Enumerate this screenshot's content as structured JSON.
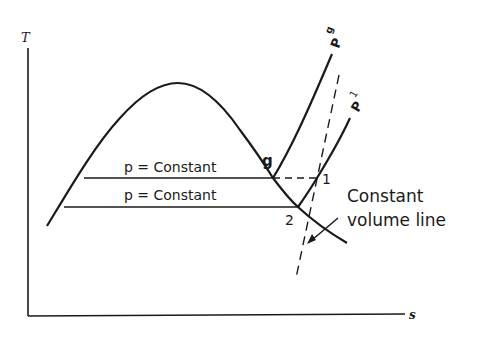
{
  "diagram": {
    "axes": {
      "y_label": "T",
      "x_label": "s"
    },
    "lines": {
      "upper_pressure_label": "p = Constant",
      "lower_pressure_label": "p = Constant",
      "pg_label": "P",
      "pg_subscript": "g",
      "p1_label": "P",
      "p1_subscript": "1",
      "constant_volume_label_line1": "Constant",
      "constant_volume_label_line2": "volume line"
    },
    "points": {
      "g": "g",
      "one": "1",
      "two": "2"
    },
    "colors": {
      "stroke": "#1a1a1a",
      "background": "#ffffff"
    }
  }
}
